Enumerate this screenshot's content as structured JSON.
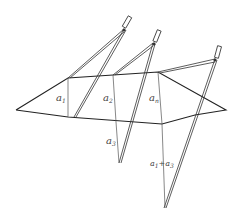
{
  "diagram": {
    "top_cut_text_left": "a",
    "top_cut_text_right": "(",
    "labels": {
      "a1": {
        "base": "a",
        "sub": "1"
      },
      "a2": {
        "base": "a",
        "sub": "2"
      },
      "an": {
        "base": "a",
        "sub": "n"
      },
      "a3": {
        "base": "a",
        "sub": "3"
      },
      "a1a3": {
        "base1": "a",
        "sub1": "1",
        "plus": "+",
        "base2": "a",
        "sub2": "3"
      }
    },
    "colors": {
      "stroke": "#222222",
      "thin": "#555555"
    }
  }
}
